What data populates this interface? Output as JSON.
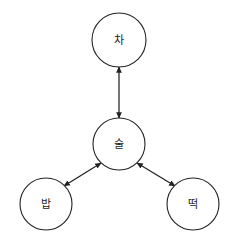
{
  "canvas": {
    "width": 239,
    "height": 243,
    "background_color": "#ffffff"
  },
  "style": {
    "stroke_color": "#222222",
    "node_fill_color": "#ffffff",
    "label_color": "#1a1a1a",
    "arrow_color": "#222222"
  },
  "diagram": {
    "type": "node-link-graph",
    "topology": "star",
    "nodes": [
      {
        "id": "cha",
        "label": "차",
        "cx": 119,
        "cy": 40,
        "r": 27,
        "role": "leaf",
        "position": "top"
      },
      {
        "id": "sul",
        "label": "술",
        "cx": 119,
        "cy": 144,
        "r": 26,
        "role": "hub",
        "position": "center"
      },
      {
        "id": "bap",
        "label": "밥",
        "cx": 46,
        "cy": 204,
        "r": 26,
        "role": "leaf",
        "position": "bottom-left"
      },
      {
        "id": "tteok",
        "label": "떡",
        "cx": 193,
        "cy": 204,
        "r": 26,
        "role": "leaf",
        "position": "bottom-right"
      }
    ],
    "edges": [
      {
        "id": "edge-sul-cha",
        "from": "sul",
        "to": "cha",
        "direction": "bidirectional",
        "x1": 119,
        "y1": 118,
        "x2": 119,
        "y2": 67
      },
      {
        "id": "edge-sul-bap",
        "from": "sul",
        "to": "bap",
        "direction": "bidirectional",
        "x1": 101,
        "y1": 163,
        "x2": 64,
        "y2": 186
      },
      {
        "id": "edge-sul-tteok",
        "from": "sul",
        "to": "tteok",
        "direction": "bidirectional",
        "x1": 137,
        "y1": 163,
        "x2": 175,
        "y2": 186
      }
    ]
  }
}
